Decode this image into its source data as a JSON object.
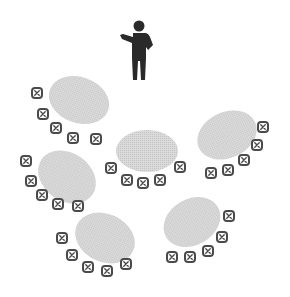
{
  "diagram": {
    "colors": {
      "background": "#ffffff",
      "table_fill": "#d2d2d2",
      "chair_outline": "#4a4a4a",
      "chair_fill": "#ffffff",
      "presenter": "#2a2a2a"
    },
    "presenter": {
      "label": "presenter",
      "icon": "standing-person-pointing-icon",
      "x": 139,
      "y": 20
    },
    "tables": [
      {
        "id": "table-1",
        "cx": 79,
        "cy": 100,
        "rx": 31,
        "ry": 23,
        "rot": 20,
        "chairs": [
          [
            37,
            93
          ],
          [
            43,
            114
          ],
          [
            56,
            128
          ],
          [
            73,
            138
          ],
          [
            96,
            139
          ]
        ]
      },
      {
        "id": "table-2",
        "cx": 147,
        "cy": 151,
        "rx": 31,
        "ry": 21,
        "rot": 0,
        "chairs": [
          [
            111,
            168
          ],
          [
            127,
            180
          ],
          [
            143,
            183
          ],
          [
            160,
            180
          ],
          [
            180,
            167
          ]
        ]
      },
      {
        "id": "table-3",
        "cx": 227,
        "cy": 135,
        "rx": 31,
        "ry": 23,
        "rot": -25,
        "chairs": [
          [
            263,
            127
          ],
          [
            257,
            145
          ],
          [
            244,
            160
          ],
          [
            228,
            170
          ],
          [
            211,
            173
          ]
        ]
      },
      {
        "id": "table-4",
        "cx": 67,
        "cy": 177,
        "rx": 31,
        "ry": 24,
        "rot": 35,
        "chairs": [
          [
            26,
            161
          ],
          [
            31,
            181
          ],
          [
            42,
            195
          ],
          [
            58,
            204
          ],
          [
            78,
            206
          ]
        ]
      },
      {
        "id": "table-5",
        "cx": 105,
        "cy": 238,
        "rx": 31,
        "ry": 24,
        "rot": 25,
        "chairs": [
          [
            62,
            238
          ],
          [
            72,
            255
          ],
          [
            88,
            267
          ],
          [
            107,
            271
          ],
          [
            126,
            264
          ]
        ]
      },
      {
        "id": "table-6",
        "cx": 192,
        "cy": 222,
        "rx": 30,
        "ry": 23,
        "rot": -30,
        "chairs": [
          [
            229,
            216
          ],
          [
            222,
            237
          ],
          [
            208,
            251
          ],
          [
            190,
            257
          ],
          [
            172,
            257
          ]
        ]
      }
    ]
  }
}
